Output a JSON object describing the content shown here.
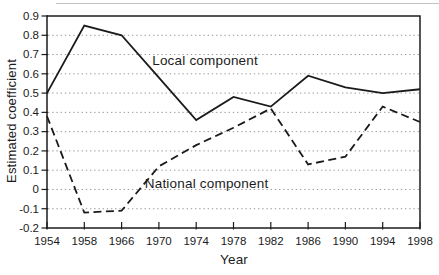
{
  "chart_data": {
    "type": "line",
    "title": "",
    "xlabel": "Year",
    "ylabel": "Estimated coefficient",
    "x_tick_labels": [
      "1954",
      "1958",
      "1966",
      "1970",
      "1974",
      "1978",
      "1982",
      "1986",
      "1990",
      "1994",
      "1998"
    ],
    "y_tick_labels": [
      "0.9",
      "0.8",
      "0.7",
      "0.6",
      "0.5",
      "0.4",
      "0.3",
      "0.2",
      "0.1",
      "0",
      "-0.1",
      "-0.2"
    ],
    "y_tick_values": [
      0.9,
      0.8,
      0.7,
      0.6,
      0.5,
      0.4,
      0.3,
      0.2,
      0.1,
      0,
      -0.1,
      -0.2
    ],
    "ylim": [
      -0.2,
      0.9
    ],
    "grid": {
      "values": [
        0.8,
        0.7,
        0.6,
        0.5,
        0.4,
        0.3,
        0.2,
        0.1,
        0,
        -0.1
      ],
      "style": "dotted",
      "color": "#9b9b9b"
    },
    "legend_position": "inline-annotations",
    "line_color": "#1a1a1a",
    "series": [
      {
        "name": "Local component",
        "line_style": "solid",
        "color": "#1a1a1a",
        "values": [
          0.5,
          0.85,
          0.8,
          0.58,
          0.36,
          0.48,
          0.43,
          0.59,
          0.53,
          0.5,
          0.52
        ]
      },
      {
        "name": "National component",
        "line_style": "dashed",
        "color": "#1a1a1a",
        "values": [
          0.38,
          -0.12,
          -0.11,
          0.12,
          0.23,
          0.32,
          0.42,
          0.13,
          0.17,
          0.43,
          0.35
        ]
      }
    ],
    "annotations": [
      {
        "text": "Local component",
        "x_index": 2.82,
        "y_value": 0.67
      },
      {
        "text": "National component",
        "x_index": 2.62,
        "y_value": 0.03
      }
    ]
  }
}
